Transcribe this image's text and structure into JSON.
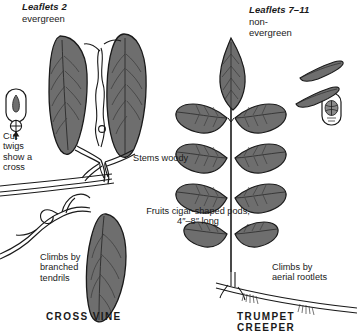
{
  "plate": {
    "background": "#ffffff",
    "ink": "#1a1a1a",
    "leaf_fill": "#6e6e6e",
    "leaf_fill_light": "#8a8a8a",
    "stem_fill": "#ffffff"
  },
  "left_panel": {
    "heading": "Leaflets 2",
    "subheading": "evergreen",
    "cut_twig_note": "Cut\ntwigs\nshow a\ncross",
    "climb_note": "Climbs by\nbranched\ntendrils",
    "species_name": "CROSS VINE",
    "inset_name": "cut-twig-cross-section-inset",
    "arrow": "up-arrow"
  },
  "center_labels": {
    "stems": "Stems woody",
    "fruits": "Fruits cigar-shaped pods,\n4″–8″ long"
  },
  "right_panel": {
    "heading": "Leaflets 7–11",
    "subheading": "non-\nevergreen",
    "climb_note": "Climbs by\naerial rootlets",
    "species_name": "TRUMPET CREEPER",
    "inset_name": "pod-cross-section-inset",
    "leaflet_pairs": 4,
    "has_terminal_leaflet": true
  }
}
